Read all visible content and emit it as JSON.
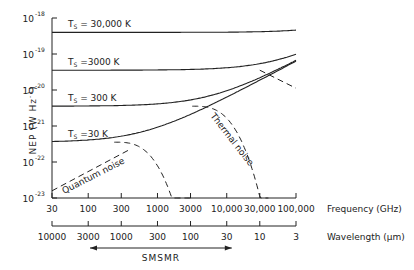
{
  "chart_data": {
    "type": "line",
    "title": "",
    "ylabel": "NEP",
    "ylabel_units": "(W Hz",
    "ylabel_units_exp": "-1",
    "ylabel_units_close": ")",
    "xlabel": "Frequency (GHz)",
    "x2label": "Wavelength (μm)",
    "xscale": "log",
    "yscale": "log",
    "xlim": [
      30,
      100000
    ],
    "ylim": [
      1e-23,
      1e-18
    ],
    "x_ticks": [
      {
        "value": 30,
        "label": "30"
      },
      {
        "value": 100,
        "label": "100"
      },
      {
        "value": 300,
        "label": "300"
      },
      {
        "value": 1000,
        "label": "1000"
      },
      {
        "value": 3000,
        "label": "3000"
      },
      {
        "value": 10000,
        "label": "10,000"
      },
      {
        "value": 30000,
        "label": "30,000"
      },
      {
        "value": 100000,
        "label": "100,000"
      }
    ],
    "x2_ticks": [
      {
        "value": 30,
        "label": "10000"
      },
      {
        "value": 100,
        "label": "3000"
      },
      {
        "value": 300,
        "label": "1000"
      },
      {
        "value": 1000,
        "label": "300"
      },
      {
        "value": 3000,
        "label": "100"
      },
      {
        "value": 10000,
        "label": "30"
      },
      {
        "value": 30000,
        "label": "10"
      },
      {
        "value": 100000,
        "label": "3"
      }
    ],
    "y_ticks": [
      {
        "exp": -18,
        "base": "10",
        "sup": "-18"
      },
      {
        "exp": -19,
        "base": "10",
        "sup": "-19"
      },
      {
        "exp": -20,
        "base": "10",
        "sup": "-20"
      },
      {
        "exp": -21,
        "base": "10",
        "sup": "-21"
      },
      {
        "exp": -22,
        "base": "10",
        "sup": "-22"
      },
      {
        "exp": -23,
        "base": "10",
        "sup": "-23"
      }
    ],
    "series": [
      {
        "name": "T_S = 30,000 K",
        "label_main": "T",
        "label_sub": "S",
        "label_rest": " = 30,000 K",
        "log_nep_flat": -18.4
      },
      {
        "name": "T_S = 3000 K",
        "label_main": "T",
        "label_sub": "S",
        "label_rest": " =3000 K",
        "log_nep_flat": -19.45
      },
      {
        "name": "T_S = 300 K",
        "label_main": "T",
        "label_sub": "S",
        "label_rest": " = 300 K",
        "log_nep_flat": -20.45
      },
      {
        "name": "T_S = 30 K",
        "label_main": "T",
        "label_sub": "S",
        "label_rest": " =30 K",
        "log_nep_flat": -21.45
      }
    ],
    "quantum_noise": {
      "label": "Quantum noise",
      "points": [
        [
          30,
          -22.8
        ],
        [
          100000,
          -19.2
        ]
      ]
    },
    "thermal_noise": {
      "label": "Thermal noise",
      "cutoff_frequencies": [
        3000,
        40000
      ]
    },
    "annotations": [
      {
        "text": "SMSMR",
        "range": [
          30,
          30000
        ],
        "arrow": "both"
      }
    ]
  }
}
